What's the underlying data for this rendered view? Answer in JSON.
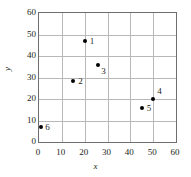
{
  "chart_data": {
    "type": "scatter",
    "title": "",
    "xlabel": "x",
    "ylabel": "y",
    "xlim": [
      0,
      60
    ],
    "ylim": [
      0,
      60
    ],
    "xticks": [
      0,
      10,
      20,
      30,
      40,
      50,
      60
    ],
    "yticks": [
      0,
      10,
      20,
      30,
      40,
      50,
      60
    ],
    "grid": true,
    "legend": "none",
    "marker_color": "#000000",
    "grid_color": "#b8b8b8",
    "frame_color": "#6e6e6e",
    "points": [
      {
        "label": "1",
        "x": 20,
        "y": 47,
        "label_dx": 5,
        "label_dy": -4
      },
      {
        "label": "2",
        "x": 15,
        "y": 28.5,
        "label_dx": 5,
        "label_dy": -4
      },
      {
        "label": "3",
        "x": 26,
        "y": 36,
        "label_dx": 3,
        "label_dy": 2
      },
      {
        "label": "4",
        "x": 50,
        "y": 20,
        "label_dx": 4,
        "label_dy": -12
      },
      {
        "label": "5",
        "x": 45,
        "y": 16,
        "label_dx": 5,
        "label_dy": -4
      },
      {
        "label": "6",
        "x": 1,
        "y": 7,
        "label_dx": 4,
        "label_dy": -4
      }
    ]
  }
}
